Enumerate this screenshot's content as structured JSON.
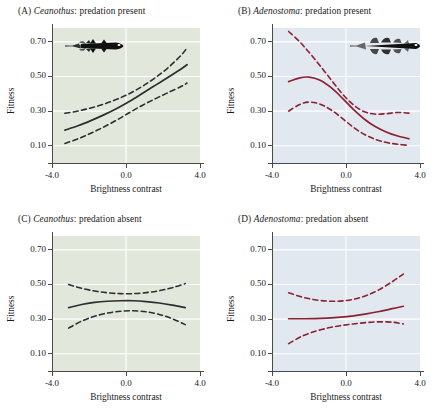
{
  "figure": {
    "axis_titles": {
      "x": "Brightness contrast",
      "y": "Fitness"
    },
    "y_ticks": [
      "0.70",
      "0.50",
      "0.30",
      "0.10"
    ],
    "y_tick_values": [
      0.7,
      0.5,
      0.3,
      0.1
    ],
    "x_ticks": [
      "-4.0",
      "0.0",
      "4.0"
    ],
    "x_tick_values": [
      -4.0,
      0.0,
      4.0
    ],
    "colors": {
      "ceanothus_background": "#e2e7dc",
      "adenostoma_background": "#e2e8f0",
      "ceanothus_curve": "#2e2e2e",
      "adenostoma_curve": "#8b2233",
      "gridline": "#ffffff",
      "axis": "#4a4a4a",
      "text": "#1a1a1a"
    }
  },
  "panels": [
    {
      "tag": "(A)",
      "genus": "Ceanothus",
      "condition": ": predation present",
      "icon": "salamander-larva-ceanothus-icon",
      "chart_data": {
        "type": "line",
        "title": "(A) Ceanothus: predation present",
        "xlabel": "Brightness contrast",
        "ylabel": "Fitness",
        "xlim": [
          -4.0,
          4.0
        ],
        "ylim": [
          0.0,
          0.78
        ],
        "grid": true,
        "background": "#e2e7dc",
        "curve_color": "#2e2e2e",
        "x": [
          -3.3,
          -2.6,
          -1.9,
          -1.2,
          -0.5,
          0.2,
          0.9,
          1.6,
          2.3,
          3.0,
          3.3
        ],
        "series": [
          {
            "name": "fitted",
            "style": "solid",
            "values": [
              0.19,
              0.215,
              0.245,
              0.278,
              0.315,
              0.357,
              0.403,
              0.45,
              0.497,
              0.545,
              0.568
            ]
          },
          {
            "name": "upper 95% CI",
            "style": "dashed",
            "values": [
              0.287,
              0.3,
              0.318,
              0.34,
              0.368,
              0.402,
              0.444,
              0.494,
              0.553,
              0.625,
              0.665
            ]
          },
          {
            "name": "lower 95% CI",
            "style": "dashed",
            "values": [
              0.113,
              0.14,
              0.172,
              0.208,
              0.248,
              0.292,
              0.334,
              0.372,
              0.408,
              0.443,
              0.462
            ]
          }
        ]
      }
    },
    {
      "tag": "(B)",
      "genus": "Adenostoma",
      "condition": ": predation present",
      "icon": "salamander-larva-adenostoma-icon",
      "chart_data": {
        "type": "line",
        "title": "(B) Adenostoma: predation present",
        "xlabel": "Brightness contrast",
        "ylabel": "Fitness",
        "xlim": [
          -4.0,
          4.0
        ],
        "ylim": [
          0.0,
          0.78
        ],
        "grid": true,
        "background": "#e2e8f0",
        "curve_color": "#8b2233",
        "x": [
          -3.1,
          -2.5,
          -2.0,
          -1.4,
          -0.8,
          -0.2,
          0.4,
          1.0,
          1.6,
          2.2,
          2.8,
          3.4
        ],
        "series": [
          {
            "name": "fitted",
            "style": "solid",
            "values": [
              0.47,
              0.492,
              0.496,
              0.478,
              0.435,
              0.375,
              0.31,
              0.253,
              0.209,
              0.178,
              0.156,
              0.14
            ]
          },
          {
            "name": "upper 95% CI",
            "style": "dashed",
            "values": [
              0.76,
              0.7,
              0.64,
              0.562,
              0.48,
              0.4,
              0.336,
              0.296,
              0.282,
              0.285,
              0.292,
              0.288
            ]
          },
          {
            "name": "lower 95% CI",
            "style": "dashed",
            "values": [
              0.3,
              0.338,
              0.352,
              0.34,
              0.306,
              0.258,
              0.206,
              0.165,
              0.136,
              0.118,
              0.108,
              0.102
            ]
          }
        ]
      }
    },
    {
      "tag": "(C)",
      "genus": "Ceanothus",
      "condition": ": predation absent",
      "icon": null,
      "chart_data": {
        "type": "line",
        "title": "(C) Ceanothus: predation absent",
        "xlabel": "Brightness contrast",
        "ylabel": "Fitness",
        "xlim": [
          -4.0,
          4.0
        ],
        "ylim": [
          0.0,
          0.78
        ],
        "grid": true,
        "background": "#e2e7dc",
        "curve_color": "#2e2e2e",
        "x": [
          -3.1,
          -2.4,
          -1.7,
          -1.0,
          -0.3,
          0.4,
          1.1,
          1.8,
          2.5,
          3.2
        ],
        "series": [
          {
            "name": "fitted",
            "style": "solid",
            "values": [
              0.366,
              0.384,
              0.396,
              0.403,
              0.406,
              0.406,
              0.401,
              0.393,
              0.381,
              0.366
            ]
          },
          {
            "name": "upper 95% CI",
            "style": "dashed",
            "values": [
              0.5,
              0.478,
              0.462,
              0.452,
              0.447,
              0.447,
              0.453,
              0.464,
              0.481,
              0.505
            ]
          },
          {
            "name": "lower 95% CI",
            "style": "dashed",
            "values": [
              0.248,
              0.288,
              0.316,
              0.335,
              0.345,
              0.348,
              0.342,
              0.327,
              0.302,
              0.268
            ]
          }
        ]
      }
    },
    {
      "tag": "(D)",
      "genus": "Adenostoma",
      "condition": ": predation absent",
      "icon": null,
      "chart_data": {
        "type": "line",
        "title": "(D) Adenostoma: predation absent",
        "xlabel": "Brightness contrast",
        "ylabel": "Fitness",
        "xlim": [
          -4.0,
          4.0
        ],
        "ylim": [
          0.0,
          0.78
        ],
        "grid": true,
        "background": "#e2e8f0",
        "curve_color": "#8b2233",
        "x": [
          -3.1,
          -2.4,
          -1.7,
          -1.0,
          -0.3,
          0.4,
          1.1,
          1.8,
          2.5,
          3.1
        ],
        "series": [
          {
            "name": "fitted",
            "style": "solid",
            "values": [
              0.302,
              0.302,
              0.303,
              0.306,
              0.311,
              0.319,
              0.33,
              0.344,
              0.36,
              0.374
            ]
          },
          {
            "name": "upper 95% CI",
            "style": "dashed",
            "values": [
              0.452,
              0.428,
              0.412,
              0.404,
              0.404,
              0.414,
              0.436,
              0.47,
              0.516,
              0.56
            ]
          },
          {
            "name": "lower 95% CI",
            "style": "dashed",
            "values": [
              0.158,
              0.2,
              0.228,
              0.248,
              0.262,
              0.272,
              0.28,
              0.284,
              0.282,
              0.272
            ]
          }
        ]
      }
    }
  ]
}
